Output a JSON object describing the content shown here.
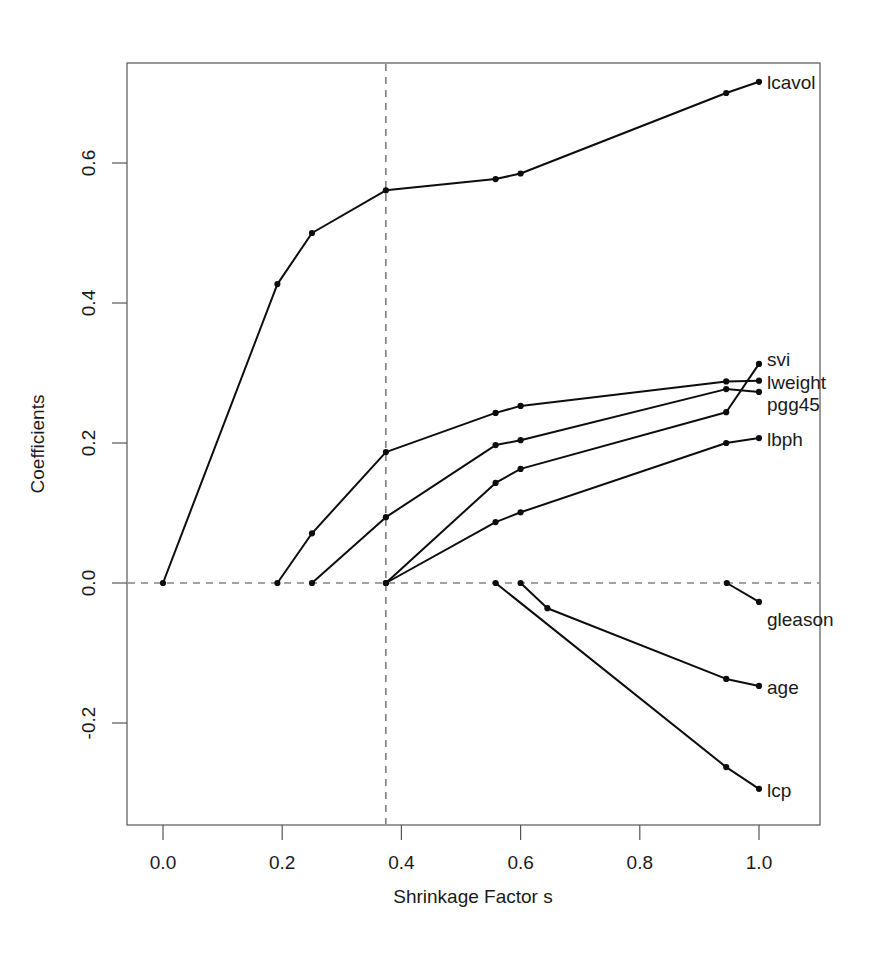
{
  "chart_data": {
    "type": "line",
    "title": "",
    "xlabel": "Shrinkage Factor s",
    "ylabel": "Coefficients",
    "xlim": [
      -0.06,
      1.1
    ],
    "ylim": [
      -0.345,
      0.775
    ],
    "xticks": [
      0.0,
      0.2,
      0.4,
      0.6,
      0.8,
      1.0
    ],
    "xtick_labels": [
      "0.0",
      "0.2",
      "0.4",
      "0.6",
      "0.8",
      "1.0"
    ],
    "yticks": [
      -0.2,
      0.0,
      0.2,
      0.4,
      0.6
    ],
    "ytick_labels": [
      "-0.2",
      "0.0",
      "0.2",
      "0.4",
      "0.6"
    ],
    "grid": false,
    "legend_position": "right-inline-labels",
    "annotations": [
      {
        "name": "zero-reference-line",
        "type": "hline",
        "y": 0.0,
        "style": "dashed"
      },
      {
        "name": "selected-shrinkage-line",
        "type": "vline",
        "x": 0.374,
        "style": "dashed"
      }
    ],
    "series": [
      {
        "name": "lcavol",
        "label": "lcavol",
        "x": [
          0.0,
          0.192,
          0.25,
          0.374,
          0.558,
          0.6,
          0.945,
          1.0
        ],
        "y": [
          0.0,
          0.427,
          0.5,
          0.561,
          0.577,
          0.585,
          0.7,
          0.716
        ]
      },
      {
        "name": "svi",
        "label": "svi",
        "x": [
          0.374,
          0.558,
          0.6,
          0.945,
          1.0
        ],
        "y": [
          0.0,
          0.143,
          0.163,
          0.244,
          0.313
        ]
      },
      {
        "name": "lweight",
        "label": "lweight",
        "x": [
          0.192,
          0.25,
          0.374,
          0.558,
          0.6,
          0.945,
          1.0
        ],
        "y": [
          0.0,
          0.071,
          0.187,
          0.243,
          0.253,
          0.288,
          0.289
        ]
      },
      {
        "name": "pgg45",
        "label": "pgg45",
        "x": [
          0.25,
          0.374,
          0.558,
          0.6,
          0.945,
          1.0
        ],
        "y": [
          0.0,
          0.094,
          0.197,
          0.204,
          0.277,
          0.273
        ]
      },
      {
        "name": "lbph",
        "label": "lbph",
        "x": [
          0.374,
          0.558,
          0.6,
          0.945,
          1.0
        ],
        "y": [
          0.0,
          0.087,
          0.101,
          0.2,
          0.207
        ]
      },
      {
        "name": "gleason",
        "label": "gleason",
        "x": [
          0.946,
          1.0
        ],
        "y": [
          0.0,
          -0.027
        ]
      },
      {
        "name": "age",
        "label": "age",
        "x": [
          0.6,
          0.645,
          0.945,
          1.0
        ],
        "y": [
          0.0,
          -0.036,
          -0.137,
          -0.147
        ]
      },
      {
        "name": "lcp",
        "label": "lcp",
        "x": [
          0.558,
          0.945,
          1.0
        ],
        "y": [
          0.0,
          -0.263,
          -0.294
        ]
      }
    ]
  },
  "axes": {
    "x_title": "Shrinkage Factor s",
    "y_title": "Coefficients"
  }
}
